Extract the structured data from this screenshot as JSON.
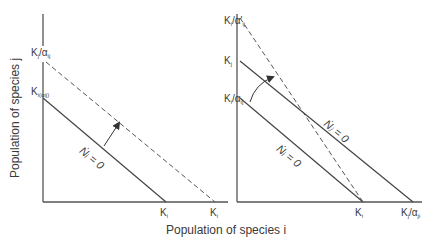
{
  "figure": {
    "x_axis_title": "Population of species i",
    "y_axis_title": "Population of species j",
    "colors": {
      "line": "#444444",
      "text": "#3a3a3a",
      "background": "#ffffff"
    }
  },
  "left_panel": {
    "y_labels": [
      {
        "main": "K",
        "sup": "'",
        "sub": "j",
        "suffix": "/α",
        "suffix_sub": "ij"
      },
      {
        "main": "K",
        "sub": "i(αij)"
      }
    ],
    "x_labels": [
      {
        "main": "K",
        "sub": "i"
      },
      {
        "main": "K",
        "sup": "'",
        "sub": "i"
      }
    ],
    "isocline_label": "Ṅᵢ = 0",
    "lines": [
      {
        "name": "original isocline",
        "style": "solid",
        "from": "K_i(alpha_ij) on y-axis",
        "to": "K_i on x-axis"
      },
      {
        "name": "shifted isocline",
        "style": "dashed",
        "from": "K'_j/alpha_ij on y-axis",
        "to": "K'_i on x-axis"
      }
    ],
    "arrow": "straight arrow from solid isocline toward dashed isocline"
  },
  "right_panel": {
    "y_labels": [
      {
        "main": "K",
        "sub": "i",
        "suffix": "/α'",
        "suffix_sub": "ij"
      },
      {
        "main": "K",
        "sub": "j"
      },
      {
        "main": "K",
        "sub": "i",
        "suffix": "/α",
        "suffix_sub": "ij"
      }
    ],
    "x_labels": [
      {
        "main": "K",
        "sub": "i"
      },
      {
        "main": "K",
        "sub": "j",
        "suffix": "/α",
        "suffix_sub": "ji"
      }
    ],
    "isocline_labels": {
      "upper": "Ṅⱼ = 0",
      "lower": "Ṅᵢ = 0"
    },
    "lines": [
      {
        "name": "N_j isocline",
        "style": "solid",
        "from": "K_j on y-axis",
        "to": "K_j/alpha_ji on x-axis"
      },
      {
        "name": "N_i isocline",
        "style": "solid",
        "from": "K_i/alpha_ij on y-axis",
        "to": "K_i on x-axis"
      },
      {
        "name": "rotated N_i isocline",
        "style": "dashed",
        "from": "K_i/alpha'_ij on y-axis",
        "to": "K_i on x-axis"
      }
    ],
    "arrow": "curved arrow indicating rotation of N_i isocline"
  }
}
